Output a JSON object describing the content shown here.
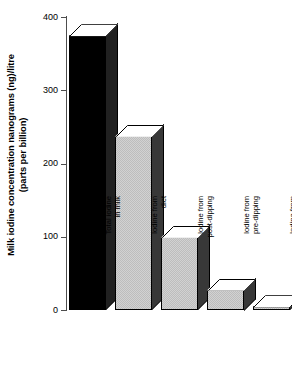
{
  "chart_data": {
    "type": "bar",
    "title": "",
    "subtitle": "",
    "xlabel": "",
    "ylabel": "Milk iodine concentration nanograms (ng)/litre (parts per billion)",
    "ylabel_lines": [
      "Milk iodine concentration nanograms (ng)/litre",
      "(parts per billion)"
    ],
    "categories": [
      "Total iodine\nin milk",
      "Iodine from\ndiet",
      "Iodine from\npost-dipping",
      "Iodine from\npre-dipping",
      "Iodine from\nudder wash and\ntank cleaner"
    ],
    "values": [
      375,
      238,
      100,
      28,
      5
    ],
    "ylim": [
      0,
      400
    ],
    "yticks": [
      0,
      100,
      200,
      300,
      400
    ],
    "ytick_labels": [
      "0",
      "100",
      "200",
      "300",
      "400"
    ],
    "grid": false,
    "legend": false,
    "bar_styles": [
      "dark",
      "light",
      "light",
      "light",
      "light"
    ],
    "colors": {
      "bar_dark_front": "#000000",
      "bar_dark_side": "#3a3a3a",
      "bar_light_front": "#d2d2d2",
      "bar_light_side": "#4f4f4f",
      "bar_cap": "#ffffff",
      "axis": "#4d4d4d",
      "text": "#000000",
      "background": "#ffffff"
    }
  }
}
